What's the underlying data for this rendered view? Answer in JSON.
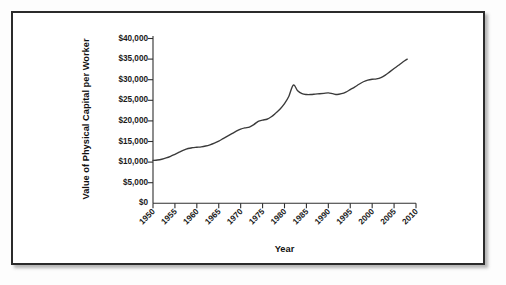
{
  "chart_data": {
    "type": "line",
    "title": "",
    "xlabel": "Year",
    "ylabel": "Value of Physical Capital per Worker",
    "xlim": [
      1950,
      2010
    ],
    "ylim": [
      0,
      40000
    ],
    "grid": false,
    "legend": false,
    "y_tick_labels": [
      "$40,000",
      "$35,000",
      "$30,000",
      "$25,000",
      "$20,000",
      "$15,000",
      "$10,000",
      "$5,000",
      "$0"
    ],
    "y_tick_values": [
      40000,
      35000,
      30000,
      25000,
      20000,
      15000,
      10000,
      5000,
      0
    ],
    "x_tick_labels": [
      "1950",
      "1955",
      "1960",
      "1965",
      "1970",
      "1975",
      "1980",
      "1985",
      "1990",
      "1995",
      "2000",
      "2005",
      "2010"
    ],
    "x_tick_values": [
      1950,
      1955,
      1960,
      1965,
      1970,
      1975,
      1980,
      1985,
      1990,
      1995,
      2000,
      2005,
      2010
    ],
    "x": [
      1950,
      1951,
      1952,
      1953,
      1954,
      1955,
      1956,
      1957,
      1958,
      1959,
      1960,
      1961,
      1962,
      1963,
      1964,
      1965,
      1966,
      1967,
      1968,
      1969,
      1970,
      1971,
      1972,
      1973,
      1974,
      1975,
      1976,
      1977,
      1978,
      1979,
      1980,
      1981,
      1982,
      1983,
      1984,
      1985,
      1986,
      1987,
      1988,
      1989,
      1990,
      1991,
      1992,
      1993,
      1994,
      1995,
      1996,
      1997,
      1998,
      1999,
      2000,
      2001,
      2002,
      2003,
      2004,
      2005,
      2006,
      2007,
      2008
    ],
    "values": [
      10400,
      10500,
      10700,
      11000,
      11400,
      11900,
      12400,
      12900,
      13300,
      13500,
      13600,
      13700,
      13900,
      14200,
      14600,
      15100,
      15700,
      16300,
      16900,
      17500,
      18000,
      18300,
      18500,
      19100,
      19900,
      20200,
      20400,
      21000,
      21900,
      22900,
      24200,
      26000,
      28700,
      27300,
      26600,
      26400,
      26400,
      26500,
      26600,
      26700,
      26800,
      26600,
      26400,
      26600,
      27000,
      27600,
      28200,
      28900,
      29500,
      29900,
      30100,
      30200,
      30500,
      31100,
      31900,
      32700,
      33500,
      34300,
      35000
    ],
    "annotations": []
  }
}
